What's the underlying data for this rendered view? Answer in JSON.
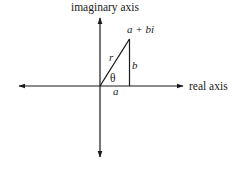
{
  "diagram": {
    "type": "complex-plane",
    "labels": {
      "imaginary_axis": "imaginary axis",
      "real_axis": "real axis",
      "point": "a + bi",
      "modulus": "r",
      "angle": "θ",
      "imaginary_part": "b",
      "real_part": "a"
    },
    "colors": {
      "line": "#1a1a1a",
      "background": "#ffffff"
    },
    "geometry": {
      "origin": [
        100,
        86
      ],
      "point": [
        129,
        39
      ],
      "real_axis_range": [
        18,
        184
      ],
      "imaginary_axis_range": [
        17,
        158
      ]
    }
  }
}
